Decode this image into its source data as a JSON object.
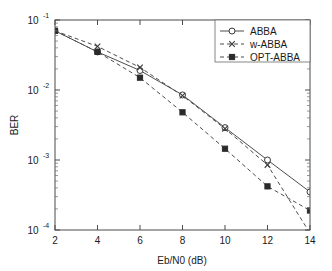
{
  "chart_data": {
    "type": "line",
    "title": "",
    "xlabel": "Eb/N0 (dB)",
    "ylabel": "BER",
    "xlim": [
      2,
      14
    ],
    "ylim": [
      0.0001,
      0.1
    ],
    "yscale": "log",
    "xscale": "linear",
    "grid": false,
    "legend_position": "top-right",
    "x": [
      2,
      4,
      6,
      8,
      10,
      12,
      14
    ],
    "xticklabels": [
      "2",
      "4",
      "6",
      "8",
      "10",
      "12",
      "14"
    ],
    "yticklabels": [
      "10^-1",
      "10^-2",
      "10^-3",
      "10^-4"
    ],
    "ytick_bases": [
      "10",
      "10",
      "10",
      "10"
    ],
    "ytick_exponents": [
      "-1",
      "-2",
      "-3",
      "-4"
    ],
    "series": [
      {
        "name": "ABBA",
        "marker": "circle-open",
        "linestyle": "solid",
        "values": [
          0.07,
          0.035,
          0.019,
          0.0085,
          0.0029,
          0.001,
          0.00035
        ]
      },
      {
        "name": "w-ABBA",
        "marker": "x",
        "linestyle": "dashed",
        "values": [
          0.07,
          0.042,
          0.021,
          0.0083,
          0.0028,
          0.00085,
          9e-05
        ]
      },
      {
        "name": "OPT-ABBA",
        "marker": "square-filled",
        "linestyle": "dashed",
        "values": [
          0.07,
          0.035,
          0.015,
          0.0048,
          0.00145,
          0.00042,
          0.00019
        ]
      }
    ]
  },
  "legend": {
    "entries": [
      {
        "label": "ABBA"
      },
      {
        "label": "w-ABBA"
      },
      {
        "label": "OPT-ABBA"
      }
    ]
  },
  "axes": {
    "xlabel": "Eb/N0 (dB)",
    "ylabel": "BER"
  }
}
